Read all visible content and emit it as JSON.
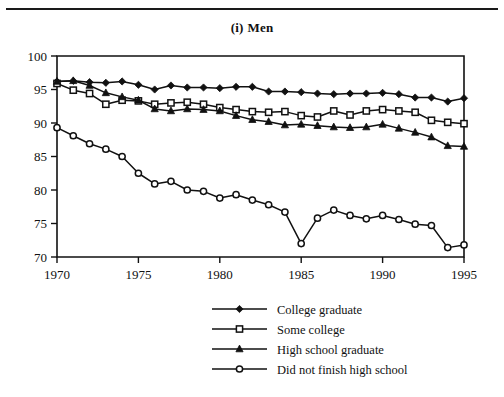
{
  "page": {
    "title_prefix": "(i)",
    "title_text": "Men"
  },
  "chart_data": {
    "type": "line",
    "xlabel": "",
    "ylabel": "",
    "xlim": [
      1970,
      1995
    ],
    "ylim": [
      70,
      100
    ],
    "xticks": [
      1970,
      1975,
      1980,
      1985,
      1990,
      1995
    ],
    "yticks": [
      70,
      75,
      80,
      85,
      90,
      95,
      100
    ],
    "grid": false,
    "legend_position": "below",
    "x": [
      1970,
      1971,
      1972,
      1973,
      1974,
      1975,
      1976,
      1977,
      1978,
      1979,
      1980,
      1981,
      1982,
      1983,
      1984,
      1985,
      1986,
      1987,
      1988,
      1989,
      1990,
      1991,
      1992,
      1993,
      1994,
      1995
    ],
    "series": [
      {
        "name": "College graduate",
        "marker": "filled-diamond",
        "values": [
          96.2,
          96.3,
          96.1,
          96.0,
          96.2,
          95.7,
          95.0,
          95.6,
          95.3,
          95.3,
          95.2,
          95.4,
          95.4,
          94.7,
          94.7,
          94.6,
          94.4,
          94.3,
          94.4,
          94.4,
          94.5,
          94.3,
          93.8,
          93.8,
          93.2,
          93.7
        ]
      },
      {
        "name": "Some college",
        "marker": "open-square",
        "values": [
          95.9,
          94.9,
          94.4,
          92.8,
          93.4,
          93.3,
          92.8,
          93.0,
          93.1,
          92.8,
          92.3,
          92.0,
          91.7,
          91.6,
          91.7,
          91.1,
          90.9,
          91.8,
          91.2,
          91.8,
          92.0,
          91.8,
          91.6,
          90.4,
          90.1,
          89.9
        ]
      },
      {
        "name": "High school graduate",
        "marker": "filled-triangle",
        "values": [
          96.2,
          96.3,
          95.6,
          94.5,
          93.9,
          93.4,
          92.1,
          91.8,
          92.1,
          92.0,
          91.8,
          91.1,
          90.5,
          90.2,
          89.7,
          89.8,
          89.6,
          89.4,
          89.3,
          89.4,
          89.8,
          89.2,
          88.6,
          87.9,
          86.6,
          86.5
        ]
      },
      {
        "name": "Did not finish high school",
        "marker": "open-circle",
        "values": [
          89.3,
          88.1,
          86.9,
          86.1,
          85.0,
          82.5,
          80.9,
          81.3,
          80.0,
          79.8,
          78.8,
          79.3,
          78.5,
          77.8,
          76.7,
          72.0,
          75.8,
          77.0,
          76.2,
          75.7,
          76.2,
          75.6,
          74.9,
          74.7,
          71.4,
          71.8
        ]
      }
    ]
  },
  "legend": {
    "items": [
      {
        "label": "College graduate",
        "marker": "filled-diamond"
      },
      {
        "label": "Some college",
        "marker": "open-square"
      },
      {
        "label": "High school graduate",
        "marker": "filled-triangle"
      },
      {
        "label": "Did not finish high school",
        "marker": "open-circle"
      }
    ]
  },
  "colors": {
    "ink": "#111111",
    "background": "#ffffff"
  }
}
